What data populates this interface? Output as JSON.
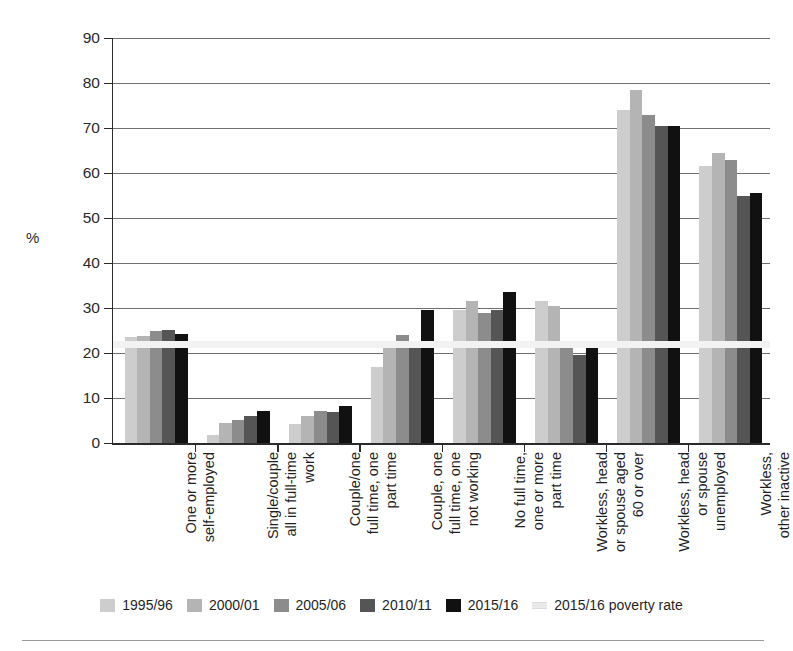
{
  "chart_data": {
    "type": "bar",
    "title": "",
    "subtitle": "",
    "xlabel": "",
    "ylabel": "%",
    "ylim": [
      0,
      90
    ],
    "yticks": [
      0,
      10,
      20,
      30,
      40,
      50,
      60,
      70,
      80,
      90
    ],
    "grid": true,
    "legend_position": "bottom",
    "categories": [
      "One or more\nself-employed",
      "Single/couple\nall in full-time\nwork",
      "Couple/one\nfull time, one\npart time",
      "Couple, one\nfull time, one\nnot working",
      "No full time,\none or more\npart time",
      "Workless, head\nor spouse aged\n60 or over",
      "Workless, head\nor spouse\nunemployed",
      "Workless,\nother inactive"
    ],
    "series": [
      {
        "name": "1995/96",
        "color": "#cdcdcd",
        "values": [
          23.5,
          1.8,
          4.2,
          17.0,
          29.5,
          31.5,
          74.0,
          61.5
        ]
      },
      {
        "name": "2000/01",
        "color": "#b4b4b4",
        "values": [
          23.8,
          4.5,
          6.0,
          21.5,
          31.5,
          30.5,
          78.5,
          64.5
        ]
      },
      {
        "name": "2005/06",
        "color": "#8c8c8c",
        "values": [
          24.8,
          5.2,
          7.2,
          24.0,
          29.0,
          22.0,
          73.0,
          63.0
        ]
      },
      {
        "name": "2010/11",
        "color": "#555555",
        "values": [
          25.2,
          6.0,
          6.8,
          22.5,
          29.5,
          19.5,
          70.5,
          55.0
        ]
      },
      {
        "name": "2015/16",
        "color": "#111111",
        "values": [
          24.2,
          7.2,
          8.2,
          29.5,
          33.5,
          21.5,
          70.5,
          55.5
        ]
      }
    ],
    "reference_line": {
      "label": "2015/16 poverty rate",
      "value": 22,
      "color": "#f2f2f2"
    }
  },
  "legend": {
    "items": [
      {
        "label": "1995/96",
        "swatch": "#cdcdcd",
        "kind": "swatch"
      },
      {
        "label": "2000/01",
        "swatch": "#b4b4b4",
        "kind": "swatch"
      },
      {
        "label": "2005/06",
        "swatch": "#8c8c8c",
        "kind": "swatch"
      },
      {
        "label": "2010/11",
        "swatch": "#555555",
        "kind": "swatch"
      },
      {
        "label": "2015/16",
        "swatch": "#111111",
        "kind": "swatch"
      },
      {
        "label": "2015/16 poverty rate",
        "swatch": "#e9e9e9",
        "kind": "line"
      }
    ]
  }
}
